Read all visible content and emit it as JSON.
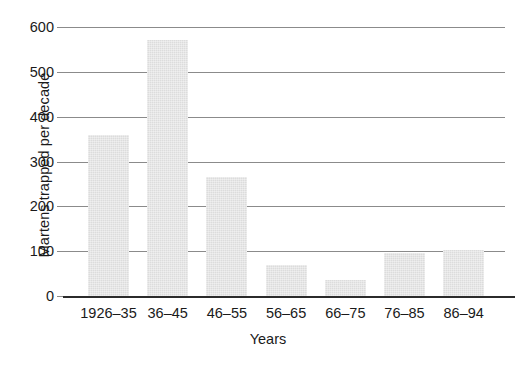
{
  "chart_data": {
    "type": "bar",
    "title": "",
    "xlabel": "Years",
    "ylabel": "Martens trapped per decade",
    "categories": [
      "1926–35",
      "36–45",
      "46–55",
      "56–65",
      "66–75",
      "76–85",
      "86–94"
    ],
    "values": [
      360,
      572,
      265,
      70,
      35,
      95,
      103
    ],
    "ylim": [
      0,
      600
    ],
    "yticks": [
      0,
      100,
      200,
      300,
      400,
      500,
      600
    ],
    "ytick_labels": [
      "0",
      "100",
      "200",
      "300",
      "400",
      "500",
      "600"
    ],
    "grid": true,
    "legend": false,
    "bar_color": "#dcdcdc",
    "axis_color": "#2b2b2b",
    "gridline_color": "#8b8b8b",
    "text_color": "#1a1a1a"
  }
}
